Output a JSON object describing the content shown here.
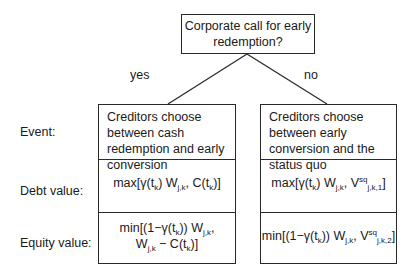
{
  "root": {
    "question_line1": "Corporate call for early",
    "question_line2": "redemption?"
  },
  "edges": {
    "yes": "yes",
    "no": "no"
  },
  "row_labels": {
    "event": "Event:",
    "debt": "Debt value:",
    "equity": "Equity value:"
  },
  "yes_branch": {
    "event": "Creditors choose between cash redemption and early conversion",
    "debt": {
      "prefix": "max[γ(t",
      "k1": "k",
      "mid": ") W",
      "jk": "j,k",
      "tail": ", C(t",
      "k2": "k",
      "end": ")]"
    },
    "equity": {
      "l1_prefix": "min[(1−γ(t",
      "l1_k": "k",
      "l1_mid": ")) W",
      "l1_jk": "j,k",
      "l1_end": ",",
      "l2_prefix": "W",
      "l2_jk": "j,k",
      "l2_mid": " − C(t",
      "l2_k": "k",
      "l2_end": ")]"
    }
  },
  "no_branch": {
    "event": "Creditors choose between early conversion and the status quo",
    "debt": {
      "prefix": "max[γ(t",
      "k1": "k",
      "mid": ") W",
      "jk": "j,k",
      "tail": ", V",
      "sq": "sq",
      "sub": "j,k,1",
      "end": "]"
    },
    "equity": {
      "prefix": "min[(1−γ(t",
      "k1": "k",
      "mid": ")) W",
      "jk": "j,k",
      "tail": ", V",
      "sq": "sq",
      "sub": "j,k,2",
      "end": "]"
    }
  },
  "colors": {
    "line": "#2a2a2a",
    "text": "#1a1a1a",
    "background": "#ffffff"
  }
}
